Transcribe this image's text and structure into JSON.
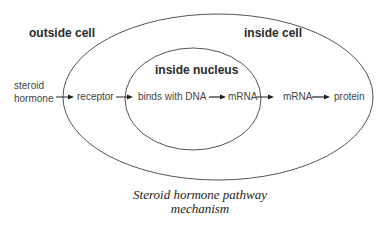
{
  "regions": {
    "outside_cell": "outside cell",
    "inside_cell": "inside cell",
    "inside_nucleus": "inside nucleus"
  },
  "flow": {
    "steroid_line1": "steroid",
    "steroid_line2": "hormone",
    "receptor": "receptor",
    "binds_dna": "binds with DNA",
    "mrna_nucleus": "mRNA",
    "mrna_cytoplasm": "mRNA",
    "protein": "protein"
  },
  "caption": {
    "line1": "Steroid hormone pathway",
    "line2": "mechanism"
  },
  "colors": {
    "line": "#555555",
    "arrow": "#222222"
  }
}
